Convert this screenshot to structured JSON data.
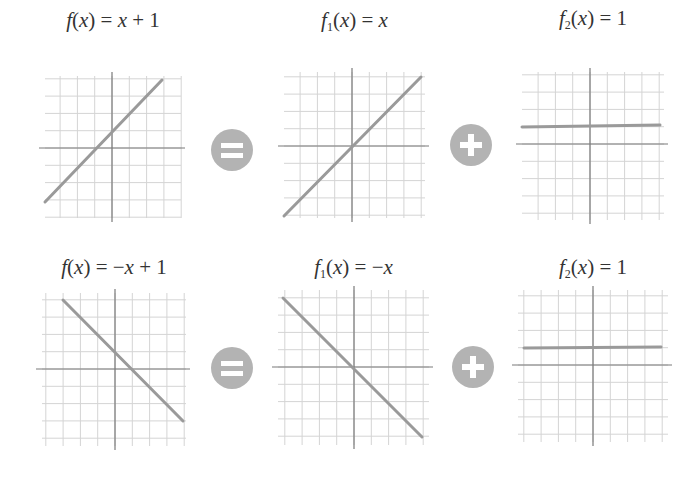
{
  "colors": {
    "grid": "#d4d4d4",
    "axis": "#7a7a7a",
    "line": "#9a9a9a",
    "operator": "#b3b3b3",
    "text": "#333333"
  },
  "rows": [
    {
      "panels": [
        {
          "label_f": "f",
          "label_sub": "",
          "label_rest": "(x) = x + 1",
          "cx": 112,
          "cy": 148,
          "label_y": 8,
          "x0": 45,
          "x1": 181,
          "y0": 76,
          "y1": 218,
          "line": {
            "x1": 45,
            "y1": 202,
            "x2": 162,
            "y2": 80
          }
        },
        {
          "label_f": "f",
          "label_sub": "1",
          "label_rest": "(x) = x",
          "cx": 352,
          "cy": 146,
          "label_y": 8,
          "x0": 284,
          "x1": 425,
          "y0": 72,
          "y1": 218,
          "line": {
            "x1": 284,
            "y1": 216,
            "x2": 421,
            "y2": 77
          }
        },
        {
          "label_f": "f",
          "label_sub": "2",
          "label_rest": "(x) = 1",
          "cx": 590,
          "cy": 144,
          "label_y": 6,
          "x0": 522,
          "x1": 664,
          "y0": 72,
          "y1": 220,
          "line": {
            "x1": 522,
            "y1": 127,
            "x2": 660,
            "y2": 125
          }
        }
      ],
      "operators": [
        {
          "type": "equals",
          "cx": 232,
          "cy": 150
        },
        {
          "type": "plus",
          "cx": 471,
          "cy": 145
        }
      ]
    },
    {
      "panels": [
        {
          "label_f": "f",
          "label_sub": "",
          "label_rest": "(x) = −x + 1",
          "cx": 115,
          "cy": 369,
          "label_y": 255,
          "x0": 42,
          "x1": 186,
          "y0": 293,
          "y1": 446,
          "line": {
            "x1": 63,
            "y1": 300,
            "x2": 183,
            "y2": 421
          }
        },
        {
          "label_f": "f",
          "label_sub": "1",
          "label_rest": "(x) = −x",
          "cx": 354,
          "cy": 367,
          "label_y": 255,
          "x0": 278,
          "x1": 429,
          "y0": 290,
          "y1": 445,
          "line": {
            "x1": 283,
            "y1": 298,
            "x2": 422,
            "y2": 437
          }
        },
        {
          "label_f": "f",
          "label_sub": "2",
          "label_rest": "(x) = 1",
          "cx": 593,
          "cy": 365,
          "label_y": 255,
          "x0": 518,
          "x1": 668,
          "y0": 290,
          "y1": 442,
          "line": {
            "x1": 524,
            "y1": 348,
            "x2": 661,
            "y2": 347
          }
        }
      ],
      "operators": [
        {
          "type": "equals",
          "cx": 232,
          "cy": 368
        },
        {
          "type": "plus",
          "cx": 473,
          "cy": 367
        }
      ]
    }
  ],
  "grid_step": 17.3,
  "chart_data": [
    {
      "type": "line",
      "title": "f(x) = x + 1",
      "slope": 1,
      "intercept": 1,
      "x_range": [
        -4,
        3
      ],
      "y_range": [
        -3,
        4
      ],
      "grid": true
    },
    {
      "type": "line",
      "title": "f1(x) = x",
      "slope": 1,
      "intercept": 0,
      "x_range": [
        -4,
        4
      ],
      "y_range": [
        -4,
        4
      ],
      "grid": true
    },
    {
      "type": "line",
      "title": "f2(x) = 1",
      "slope": 0,
      "intercept": 1,
      "x_range": [
        -4,
        4
      ],
      "y_range": [
        -4,
        4
      ],
      "grid": true
    },
    {
      "type": "line",
      "title": "f(x) = -x + 1",
      "slope": -1,
      "intercept": 1,
      "x_range": [
        -3,
        4
      ],
      "y_range": [
        -3,
        4
      ],
      "grid": true
    },
    {
      "type": "line",
      "title": "f1(x) = -x",
      "slope": -1,
      "intercept": 0,
      "x_range": [
        -4,
        4
      ],
      "y_range": [
        -4,
        4
      ],
      "grid": true
    },
    {
      "type": "line",
      "title": "f2(x) = 1",
      "slope": 0,
      "intercept": 1,
      "x_range": [
        -4,
        4
      ],
      "y_range": [
        -4,
        4
      ],
      "grid": true
    }
  ]
}
